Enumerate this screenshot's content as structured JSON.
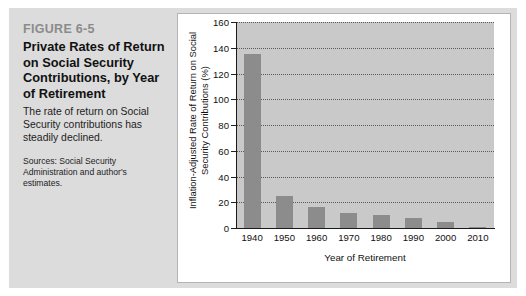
{
  "figure": {
    "number": "FIGURE 6-5",
    "title": "Private Rates of Return on Social Security Contributions, by Year of Retirement",
    "description": "The rate of return on Social Security contributions has steadily declined.",
    "source": "Sources: Social Security Administration and author's estimates."
  },
  "colors": {
    "panel_background": "#dcdcdc",
    "chart_background": "#ffffff",
    "plot_background": "#c9c9c9",
    "bar": "#8c8c8c",
    "axis": "#1a1a1a",
    "figure_number": "#8b8b8b"
  },
  "chart_data": {
    "type": "bar",
    "title": "",
    "xlabel": "Year of Retirement",
    "ylabel": "Inflation-Adjusted Rate of Return on Social Security Contributions (%)",
    "categories": [
      "1940",
      "1950",
      "1960",
      "1970",
      "1980",
      "1990",
      "2000",
      "2010"
    ],
    "values": [
      135,
      25,
      16,
      12,
      10,
      8,
      5,
      1
    ],
    "ylim": [
      0,
      160
    ],
    "ytick_labels": [
      "0",
      "20",
      "40",
      "60",
      "80",
      "100",
      "120",
      "140",
      "160"
    ],
    "ytick_values": [
      0,
      20,
      40,
      60,
      80,
      100,
      120,
      140,
      160
    ],
    "grid": true,
    "legend": "none"
  }
}
